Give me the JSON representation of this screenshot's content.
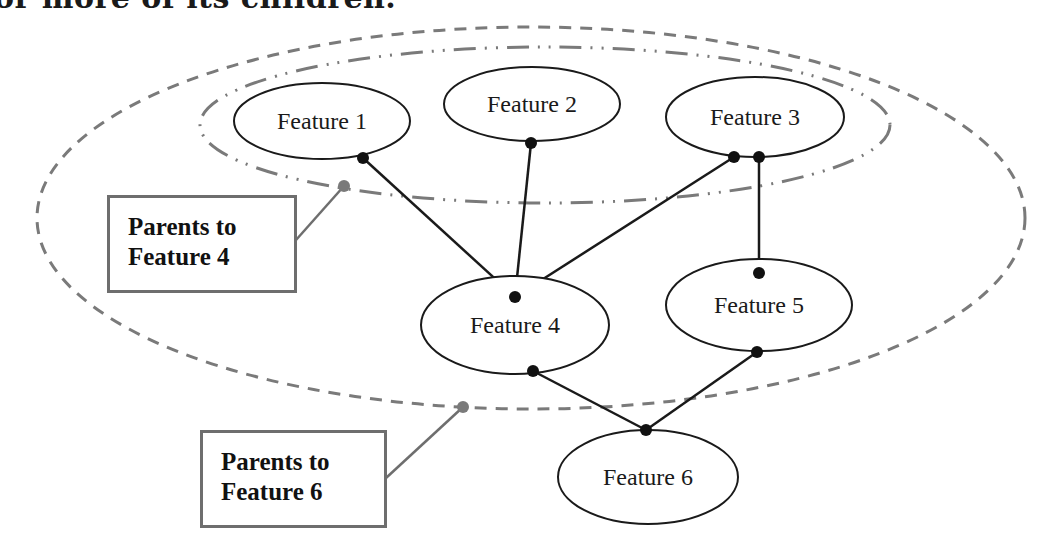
{
  "header": {
    "text": "or more of its children."
  },
  "colors": {
    "node_stroke": "#1a1a1a",
    "edge": "#1a1a1a",
    "group_stroke": "#7a7a7a",
    "callout_border": "#6e6e6e",
    "callout_leader": "#6e6e6e"
  },
  "nodes": [
    {
      "id": "f1",
      "label": "Feature 1",
      "cx": 322,
      "cy": 121,
      "rx": 88,
      "ry": 38
    },
    {
      "id": "f2",
      "label": "Feature 2",
      "cx": 532,
      "cy": 104,
      "rx": 88,
      "ry": 37
    },
    {
      "id": "f3",
      "label": "Feature 3",
      "cx": 755,
      "cy": 117,
      "rx": 89,
      "ry": 40
    },
    {
      "id": "f4",
      "label": "Feature 4",
      "cx": 515,
      "cy": 325,
      "rx": 94,
      "ry": 49
    },
    {
      "id": "f5",
      "label": "Feature 5",
      "cx": 759,
      "cy": 305,
      "rx": 93,
      "ry": 46
    },
    {
      "id": "f6",
      "label": "Feature 6",
      "cx": 648,
      "cy": 477,
      "rx": 90,
      "ry": 47
    }
  ],
  "edges": [
    {
      "from": "f1",
      "to": "f4",
      "x1": 363,
      "y1": 158,
      "x2": 515,
      "y2": 297
    },
    {
      "from": "f2",
      "to": "f4",
      "x1": 531,
      "y1": 143,
      "x2": 515,
      "y2": 297
    },
    {
      "from": "f3",
      "to": "f4",
      "x1": 734,
      "y1": 157,
      "x2": 515,
      "y2": 297
    },
    {
      "from": "f3",
      "to": "f5",
      "x1": 759,
      "y1": 157,
      "x2": 759,
      "y2": 273
    },
    {
      "from": "f4",
      "to": "f6",
      "x1": 533,
      "y1": 371,
      "x2": 646,
      "y2": 430
    },
    {
      "from": "f5",
      "to": "f6",
      "x1": 757,
      "y1": 352,
      "x2": 646,
      "y2": 430
    }
  ],
  "groups": [
    {
      "id": "parents-of-f4",
      "style": "dash-dot",
      "cx": 545,
      "cy": 125,
      "rx": 345,
      "ry": 78
    },
    {
      "id": "parents-of-f6",
      "style": "dashed",
      "cx": 531,
      "cy": 218,
      "rx": 494,
      "ry": 191
    }
  ],
  "callouts": [
    {
      "id": "callout-f4",
      "lines": [
        "Parents to",
        "Feature 4"
      ],
      "box": {
        "x": 107,
        "y": 195,
        "w": 190,
        "h": 98
      },
      "leader": {
        "x1": 296,
        "y1": 240,
        "x2": 344,
        "y2": 186
      }
    },
    {
      "id": "callout-f6",
      "lines": [
        "Parents to",
        "Feature 6"
      ],
      "box": {
        "x": 200,
        "y": 430,
        "w": 187,
        "h": 98
      },
      "leader": {
        "x1": 386,
        "y1": 478,
        "x2": 463,
        "y2": 407
      }
    }
  ]
}
